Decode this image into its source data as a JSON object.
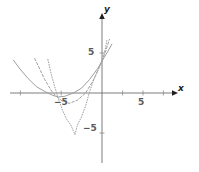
{
  "figure": {
    "title": "",
    "background_color": "#ffffff",
    "axis_color": "#6d6e71",
    "curve_color": "#9d9ea0",
    "label_color": "#58595b",
    "axis_label_color": "#231f20"
  },
  "axis_labels": {
    "x": "x",
    "y": "y"
  },
  "tick_labels": {
    "x_positive": "5",
    "x_negative": "−5",
    "y_positive": "5",
    "y_negative": "−5"
  },
  "chart_data": {
    "type": "line",
    "title": "",
    "xlabel": "x",
    "ylabel": "y",
    "xlim": [
      -12.0,
      11.5
    ],
    "ylim": [
      -10.5,
      10.5
    ],
    "grid": false,
    "legend": null,
    "axes": {
      "origin_px": [
        102,
        93
      ],
      "pixels_per_unit_x": 8.2,
      "pixels_per_unit_y": 8.0,
      "x_ticks": [
        -10,
        -5,
        5,
        10
      ],
      "y_ticks": [
        -5,
        5
      ],
      "x_tick_labels_shown": [
        "−5",
        "5"
      ],
      "y_tick_labels_shown": [
        "5",
        "−5"
      ],
      "arrow_heads": [
        "x-positive",
        "y-positive"
      ]
    },
    "series": [
      {
        "name": "wide-parabola",
        "style": "solid",
        "equation": "y = 0.16(x + 5.3)^2 - 0.5",
        "vertex": [
          -5.3,
          -0.5
        ],
        "y_intercept": 4.0,
        "x_domain": [
          -10.8,
          1.2
        ],
        "points": [
          [
            -10.8,
            4.1
          ],
          [
            -10.0,
            3.0
          ],
          [
            -9.0,
            1.8
          ],
          [
            -8.0,
            0.8
          ],
          [
            -7.0,
            0.2
          ],
          [
            -6.0,
            -0.3
          ],
          [
            -5.3,
            -0.5
          ],
          [
            -4.5,
            -0.4
          ],
          [
            -3.5,
            0.0
          ],
          [
            -2.5,
            0.6
          ],
          [
            -1.5,
            1.7
          ],
          [
            -0.5,
            3.1
          ],
          [
            0.0,
            4.0
          ],
          [
            0.6,
            5.0
          ],
          [
            1.2,
            6.1
          ]
        ]
      },
      {
        "name": "medium-parabola",
        "style": "dashed",
        "equation": "y = 0.33(x + 4.0)^2 - 1.3",
        "vertex": [
          -4.0,
          -1.3
        ],
        "y_intercept": 4.0,
        "x_domain": [
          -8.2,
          0.9
        ],
        "points": [
          [
            -8.2,
            4.3
          ],
          [
            -7.5,
            2.8
          ],
          [
            -7.0,
            1.7
          ],
          [
            -6.0,
            0.0
          ],
          [
            -5.0,
            -0.9
          ],
          [
            -4.0,
            -1.3
          ],
          [
            -3.0,
            -0.9
          ],
          [
            -2.0,
            0.0
          ],
          [
            -1.0,
            1.7
          ],
          [
            0.0,
            4.0
          ],
          [
            0.5,
            5.4
          ],
          [
            0.9,
            6.7
          ]
        ]
      },
      {
        "name": "narrow-parabola",
        "style": "dotted",
        "equation": "y = 0.85(x + 3.3)^2 - 5.2",
        "vertex": [
          -3.3,
          -5.2
        ],
        "y_intercept": 4.0,
        "x_domain": [
          -6.6,
          0.6
        ],
        "points": [
          [
            -6.6,
            4.2
          ],
          [
            -6.2,
            2.4
          ],
          [
            -5.8,
            0.9
          ],
          [
            -5.3,
            -0.8
          ],
          [
            -4.8,
            -2.2
          ],
          [
            -4.3,
            -3.3
          ],
          [
            -3.8,
            -4.0
          ],
          [
            -3.3,
            -5.2
          ],
          [
            -3.0,
            -4.0
          ],
          [
            -2.5,
            -3.0
          ],
          [
            -2.0,
            -1.6
          ],
          [
            -1.5,
            0.2
          ],
          [
            -1.0,
            1.7
          ],
          [
            -0.5,
            2.8
          ],
          [
            0.0,
            4.0
          ],
          [
            0.4,
            5.5
          ],
          [
            0.6,
            6.6
          ]
        ]
      }
    ]
  }
}
